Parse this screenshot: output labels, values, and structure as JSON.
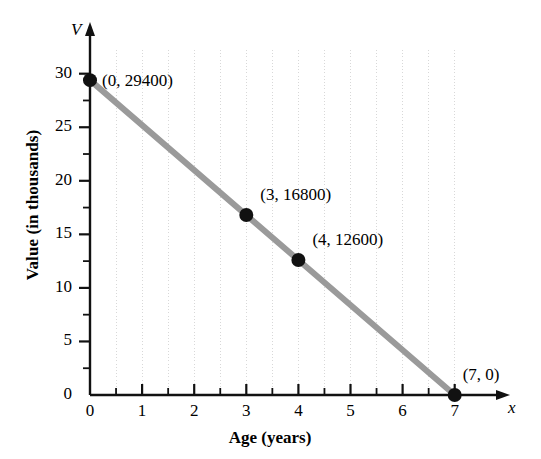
{
  "chart_data": {
    "type": "line",
    "title": "",
    "xlabel": "Age (years)",
    "ylabel": "Value (in thousands)",
    "x_axis_symbol": "x",
    "y_axis_symbol": "V",
    "xlim": [
      0,
      7.6
    ],
    "ylim": [
      0,
      34.5
    ],
    "grid": true,
    "grid_style": "dotted",
    "legend": "none",
    "x_ticks": [
      0,
      1,
      2,
      3,
      4,
      5,
      6,
      7
    ],
    "x_tick_labels": [
      "0",
      "1",
      "2",
      "3",
      "4",
      "5",
      "6",
      "7"
    ],
    "x_minor_tick_step": 0.5,
    "y_ticks": [
      0,
      5,
      10,
      15,
      20,
      25,
      30
    ],
    "y_tick_labels": [
      "0",
      "5",
      "10",
      "15",
      "20",
      "25",
      "30"
    ],
    "y_minor_tick_step": 2.5,
    "series": [
      {
        "name": "Depreciation",
        "color": "#9a9a9a",
        "x": [
          0,
          7
        ],
        "y": [
          29.4,
          0
        ],
        "units": "thousands of dollars"
      }
    ],
    "points": [
      {
        "x": 0,
        "y": 29.4,
        "label": "(0, 29400)",
        "value": 29400,
        "label_dx": 12,
        "label_dy": -9
      },
      {
        "x": 3,
        "y": 16.8,
        "label": "(3, 16800)",
        "value": 16800,
        "label_dx": 14,
        "label_dy": -30
      },
      {
        "x": 4,
        "y": 12.6,
        "label": "(4, 12600)",
        "value": 12600,
        "label_dx": 14,
        "label_dy": -30
      },
      {
        "x": 7,
        "y": 0,
        "label": "(7, 0)",
        "value": 0,
        "label_dx": 8,
        "label_dy": -30
      }
    ],
    "marker_color": "#111111",
    "marker_radius": 7,
    "axis_color": "#111111",
    "grid_color": "#d8d8d8"
  }
}
